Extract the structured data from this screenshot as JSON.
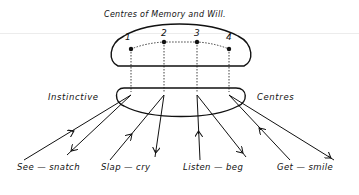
{
  "diagram": {
    "title": "Centres of Memory and Will.",
    "left_label": "Instinctive",
    "right_label": "Centres",
    "memory_nodes": [
      {
        "label": "1"
      },
      {
        "label": "2"
      },
      {
        "label": "3"
      },
      {
        "label": "4"
      }
    ],
    "reflexes": [
      {
        "label": "See — snatch",
        "stimulus": "See",
        "response": "snatch"
      },
      {
        "label": "Slap — cry",
        "stimulus": "Slap",
        "response": "cry"
      },
      {
        "label": "Listen — beg",
        "stimulus": "Listen",
        "response": "beg"
      },
      {
        "label": "Get — smile",
        "stimulus": "Get",
        "response": "smile"
      }
    ],
    "colors": {
      "ink": "#111111",
      "background": "#ffffff"
    }
  }
}
